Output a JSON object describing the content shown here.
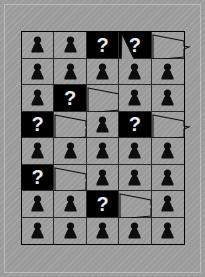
{
  "board": {
    "title": "Pawn Grid Puzzle",
    "columns": 5,
    "rows": 8,
    "colors": {
      "background": "#9b9b9b",
      "cell_dark": "#000000",
      "grid_line": "#2a2a2a",
      "pawn": "#0d0d0d",
      "question_mark": "#e8e8e8"
    },
    "question_label": "?",
    "legend": {
      "pawn_name": "pawn-icon",
      "question_name": "question-mark-cell",
      "balloon_name": "speech-balloon"
    },
    "cells": [
      {
        "r": 1,
        "c": 1,
        "type": "pawn"
      },
      {
        "r": 1,
        "c": 2,
        "type": "pawn"
      },
      {
        "r": 1,
        "c": 3,
        "type": "question"
      },
      {
        "r": 1,
        "c": 4,
        "type": "question",
        "tail": "down"
      },
      {
        "r": 1,
        "c": 5,
        "type": "balloon"
      },
      {
        "r": 2,
        "c": 1,
        "type": "pawn"
      },
      {
        "r": 2,
        "c": 2,
        "type": "pawn"
      },
      {
        "r": 2,
        "c": 3,
        "type": "pawn"
      },
      {
        "r": 2,
        "c": 4,
        "type": "pawn"
      },
      {
        "r": 2,
        "c": 5,
        "type": "pawn"
      },
      {
        "r": 3,
        "c": 1,
        "type": "pawn"
      },
      {
        "r": 3,
        "c": 2,
        "type": "question"
      },
      {
        "r": 3,
        "c": 3,
        "type": "balloon"
      },
      {
        "r": 3,
        "c": 4,
        "type": "pawn"
      },
      {
        "r": 3,
        "c": 5,
        "type": "pawn"
      },
      {
        "r": 4,
        "c": 1,
        "type": "question"
      },
      {
        "r": 4,
        "c": 2,
        "type": "balloon"
      },
      {
        "r": 4,
        "c": 3,
        "type": "pawn"
      },
      {
        "r": 4,
        "c": 4,
        "type": "question"
      },
      {
        "r": 4,
        "c": 5,
        "type": "balloon"
      },
      {
        "r": 5,
        "c": 1,
        "type": "pawn"
      },
      {
        "r": 5,
        "c": 2,
        "type": "pawn"
      },
      {
        "r": 5,
        "c": 3,
        "type": "pawn"
      },
      {
        "r": 5,
        "c": 4,
        "type": "pawn"
      },
      {
        "r": 5,
        "c": 5,
        "type": "pawn"
      },
      {
        "r": 6,
        "c": 1,
        "type": "question"
      },
      {
        "r": 6,
        "c": 2,
        "type": "balloon"
      },
      {
        "r": 6,
        "c": 3,
        "type": "pawn"
      },
      {
        "r": 6,
        "c": 4,
        "type": "pawn"
      },
      {
        "r": 6,
        "c": 5,
        "type": "pawn"
      },
      {
        "r": 7,
        "c": 1,
        "type": "pawn"
      },
      {
        "r": 7,
        "c": 2,
        "type": "pawn"
      },
      {
        "r": 7,
        "c": 3,
        "type": "question"
      },
      {
        "r": 7,
        "c": 4,
        "type": "balloon"
      },
      {
        "r": 7,
        "c": 5,
        "type": "pawn"
      },
      {
        "r": 8,
        "c": 1,
        "type": "pawn"
      },
      {
        "r": 8,
        "c": 2,
        "type": "pawn"
      },
      {
        "r": 8,
        "c": 3,
        "type": "pawn"
      },
      {
        "r": 8,
        "c": 4,
        "type": "pawn"
      },
      {
        "r": 8,
        "c": 5,
        "type": "pawn"
      }
    ]
  }
}
